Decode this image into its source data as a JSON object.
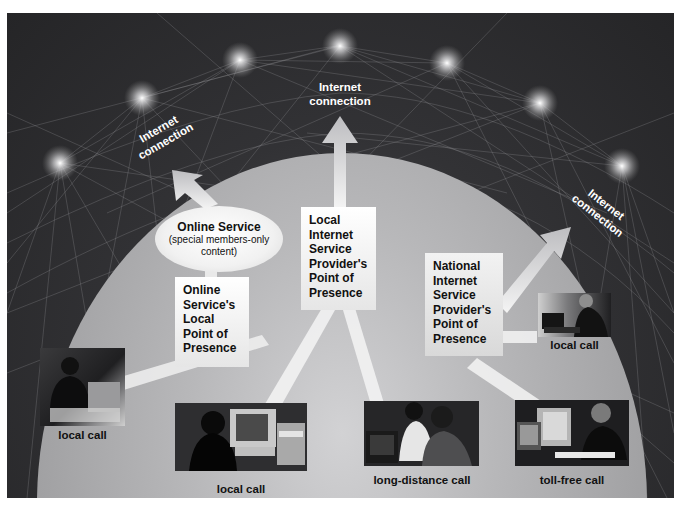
{
  "diagram": {
    "internet_labels": {
      "left": "Internet connection",
      "left_line1": "Internet",
      "left_line2": "connection",
      "center_line1": "Internet",
      "center_line2": "connection",
      "right_line1": "Internet",
      "right_line2": "connection"
    },
    "online_service": {
      "title": "Online Service",
      "subtitle_line1": "(special members-only",
      "subtitle_line2": "content)"
    },
    "boxes": {
      "online_pop": [
        "Online",
        "Service's",
        "Local",
        "Point of",
        "Presence"
      ],
      "local_isp_pop": [
        "Local",
        "Internet",
        "Service",
        "Provider's",
        "Point of",
        "Presence"
      ],
      "national_isp_pop": [
        "National",
        "Internet",
        "Service",
        "Provider's",
        "Point of",
        "Presence"
      ]
    },
    "captions": {
      "woman_left": "local call",
      "woman_computer": "local call",
      "long_distance": "long-distance call",
      "toll_free": "toll-free call",
      "man_laptop": "local call"
    },
    "colors": {
      "background_dark": "#2a2a2c",
      "dome_light": "#c8c8ca",
      "box_fill": "#ffffff",
      "text_dark": "#111111",
      "text_light": "#ffffff"
    }
  }
}
